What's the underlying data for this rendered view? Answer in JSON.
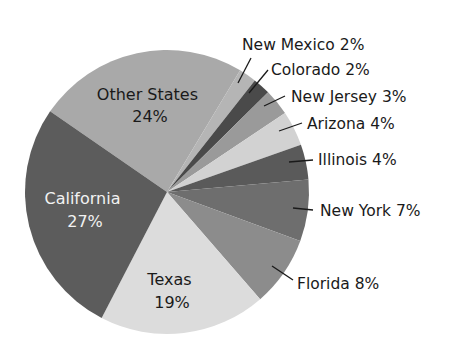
{
  "chart_data": {
    "type": "pie",
    "title": "",
    "slices": [
      {
        "label": "Other States",
        "value": 24,
        "color": "#a9a9a9",
        "label_inside": true,
        "text_color": "#1a1a1a"
      },
      {
        "label": "New Mexico",
        "value": 2,
        "color": "#b5b5b5",
        "label_inside": false
      },
      {
        "label": "Colorado",
        "value": 2,
        "color": "#4a4a4a",
        "label_inside": false
      },
      {
        "label": "New Jersey",
        "value": 3,
        "color": "#9a9a9a",
        "label_inside": false
      },
      {
        "label": "Arizona",
        "value": 4,
        "color": "#d2d2d2",
        "label_inside": false
      },
      {
        "label": "Illinois",
        "value": 4,
        "color": "#5a5a5a",
        "label_inside": false
      },
      {
        "label": "New York",
        "value": 7,
        "color": "#6e6e6e",
        "label_inside": false
      },
      {
        "label": "Florida",
        "value": 8,
        "color": "#8c8c8c",
        "label_inside": false
      },
      {
        "label": "Texas",
        "value": 19,
        "color": "#dcdcdc",
        "label_inside": true,
        "text_color": "#1a1a1a"
      },
      {
        "label": "California",
        "value": 27,
        "color": "#5c5c5c",
        "label_inside": true,
        "text_color": "#f2f2f2"
      }
    ],
    "legend": "none",
    "label_format": "{label} {value}%"
  },
  "labels": {
    "other_states": {
      "name": "Other States",
      "pct": "24%"
    },
    "california": {
      "name": "California",
      "pct": "27%"
    },
    "texas": {
      "name": "Texas",
      "pct": "19%"
    },
    "new_mexico": "New Mexico 2%",
    "colorado": "Colorado 2%",
    "new_jersey": "New Jersey 3%",
    "arizona": "Arizona 4%",
    "illinois": "Illinois 4%",
    "new_york": "New York 7%",
    "florida": "Florida 8%"
  }
}
